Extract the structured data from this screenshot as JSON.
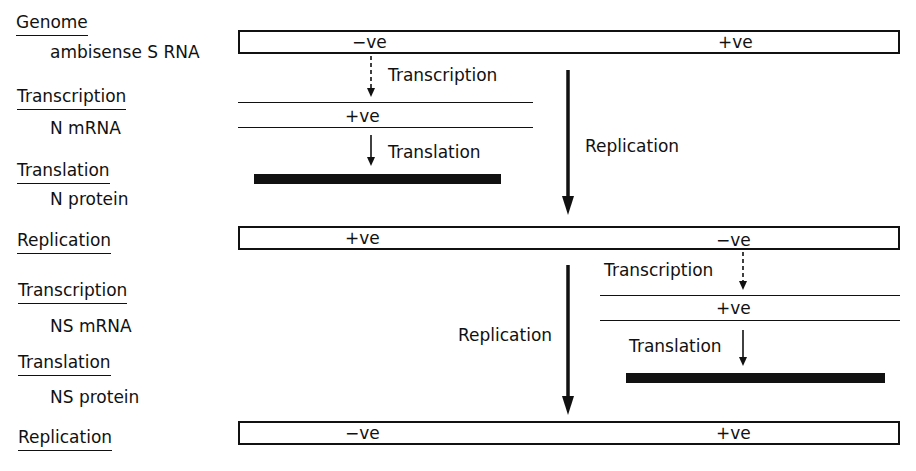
{
  "left_labels": [
    {
      "stage": "Genome",
      "item": "ambisense S RNA"
    },
    {
      "stage": "Transcription",
      "item": "N mRNA"
    },
    {
      "stage": "Translation",
      "item": "N protein"
    },
    {
      "stage": "Replication",
      "item": ""
    },
    {
      "stage": "Transcription",
      "item": "NS mRNA"
    },
    {
      "stage": "Translation",
      "item": "NS protein"
    },
    {
      "stage": "Replication",
      "item": ""
    }
  ],
  "strands": {
    "genome": {
      "left": "−ve",
      "right": "+ve"
    },
    "n_mrna": {
      "label": "+ve"
    },
    "replication1": {
      "left": "+ve",
      "right": "−ve"
    },
    "ns_mrna": {
      "label": "+ve"
    },
    "replication2": {
      "left": "−ve",
      "right": "+ve"
    }
  },
  "arrow_labels": {
    "transcription_n": "Transcription",
    "translation_n": "Translation",
    "replication_1": "Replication",
    "transcription_ns": "Transcription",
    "translation_ns": "Translation",
    "replication_2": "Replication"
  }
}
